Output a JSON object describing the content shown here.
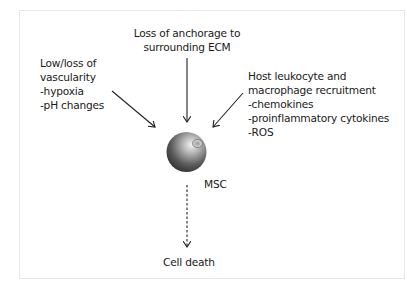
{
  "diagram": {
    "top_cause": {
      "lines": [
        "Loss of anchorage to",
        "surrounding ECM"
      ]
    },
    "left_cause": {
      "lines": [
        "Low/loss of",
        "vascularity",
        "-hypoxia",
        "-pH changes"
      ]
    },
    "right_cause": {
      "lines": [
        "Host leukocyte and",
        "macrophage recruitment",
        "-chemokines",
        "-proinflammatory cytokines",
        "-ROS"
      ]
    },
    "cell": {
      "label": "MSC",
      "icon": "sphere-cell-icon"
    },
    "outcome": {
      "label": "Cell death"
    },
    "arrows": [
      {
        "from": "left_cause",
        "to": "cell",
        "style": "solid"
      },
      {
        "from": "top_cause",
        "to": "cell",
        "style": "solid"
      },
      {
        "from": "right_cause",
        "to": "cell",
        "style": "solid"
      },
      {
        "from": "cell",
        "to": "outcome",
        "style": "dashed"
      }
    ],
    "colors": {
      "text": "#1a1a1a",
      "arrow": "#222222",
      "frame": "#e6e6e6"
    }
  }
}
